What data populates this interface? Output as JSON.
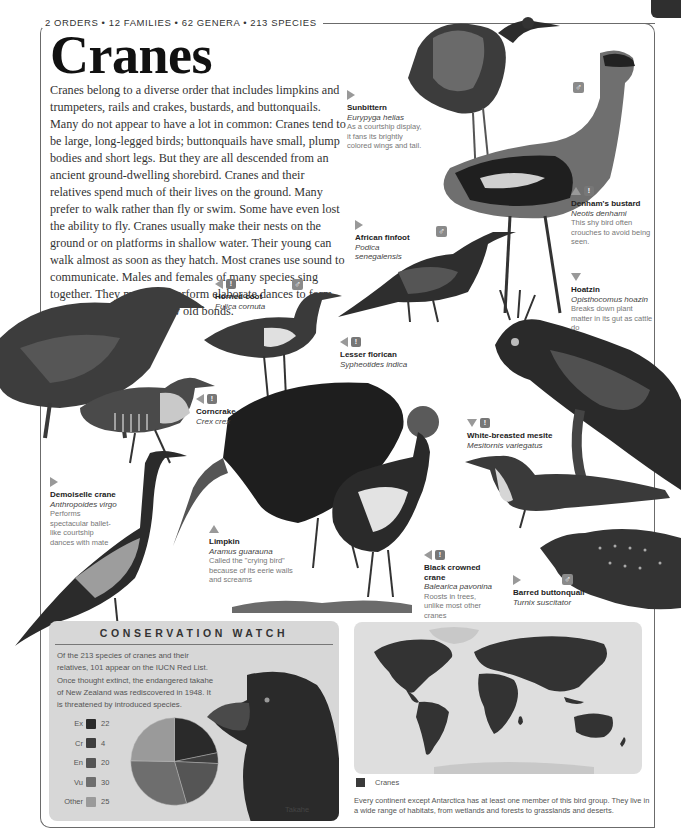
{
  "header": {
    "stats": "2 ORDERS • 12 FAMILIES • 62 GENERA • 213 SPECIES",
    "title": "Cranes"
  },
  "intro": "Cranes belong to a diverse order that includes limpkins and trumpeters, rails and crakes, bustards, and buttonquails. Many do not appear to have a lot in common: Cranes tend to be large, long-legged birds; buttonquails have small, plump bodies and short legs. But they are all descended from an ancient ground-dwelling shorebird. Cranes and their relatives spend much of their lives on the ground. Many prefer to walk rather than fly or swim. Some have even lost the ability to fly. Cranes usually make their nests on the ground or on platforms in shallow water. Their young can walk almost as soon as they hatch. Most cranes use sound to communicate. Males and females of many species sing together. They may also perform elaborate dances to form new mating pairs or renew old bonds.",
  "species": [
    {
      "id": "sunbittern",
      "common": "Sunbittern",
      "latin": "Eurypyga helias",
      "desc": "As a courtship display, it fans its brightly colored wings and tail.",
      "pointer": "right",
      "status": ""
    },
    {
      "id": "denhams-bustard",
      "common": "Denham's bustard",
      "latin": "Neotis denhami",
      "desc": "This shy bird often crouches to avoid being seen.",
      "pointer": "up",
      "status": "!"
    },
    {
      "id": "african-finfoot",
      "common": "African finfoot",
      "latin": "Podica senegalensis",
      "desc": "",
      "pointer": "right",
      "status": ""
    },
    {
      "id": "hoatzin",
      "common": "Hoatzin",
      "latin": "Opisthocomus hoazin",
      "desc": "Breaks down plant matter in its gut as cattle do",
      "pointer": "down",
      "status": ""
    },
    {
      "id": "horned-coot",
      "common": "Horned coot",
      "latin": "Fulica cornuta",
      "desc": "",
      "pointer": "left",
      "status": "!"
    },
    {
      "id": "lesser-florican",
      "common": "Lesser florican",
      "latin": "Sypheotides indica",
      "desc": "",
      "pointer": "left",
      "status": "!"
    },
    {
      "id": "corncrake",
      "common": "Corncrake",
      "latin": "Crex crex",
      "desc": "",
      "pointer": "left",
      "status": "!"
    },
    {
      "id": "white-breasted-mesite",
      "common": "White-breasted mesite",
      "latin": "Mesitornis variegatus",
      "desc": "",
      "pointer": "down",
      "status": "!"
    },
    {
      "id": "demoiselle-crane",
      "common": "Demoiselle crane",
      "latin": "Anthropoides virgo",
      "desc": "Performs spectacular ballet-like courtship dances with mate",
      "pointer": "right",
      "status": ""
    },
    {
      "id": "limpkin",
      "common": "Limpkin",
      "latin": "Aramus guarauna",
      "desc": "Called the \"crying bird\" because of its eerie wails and screams",
      "pointer": "up",
      "status": ""
    },
    {
      "id": "black-crowned-crane",
      "common": "Black crowned crane",
      "latin": "Balearica pavonina",
      "desc": "Roosts in trees, unlike most other cranes",
      "pointer": "left",
      "status": "!"
    },
    {
      "id": "barred-buttonquail",
      "common": "Barred buttonquail",
      "latin": "Turnix suscitator",
      "desc": "",
      "pointer": "right",
      "status": ""
    }
  ],
  "male_symbol": "♂",
  "conservation": {
    "title": "CONSERVATION WATCH",
    "text": "Of the 213 species of cranes and their relatives, 101 appear on the IUCN Red List. Once thought extinct, the endangered takahe of New Zealand was rediscovered in 1948. It is threatened by introduced species.",
    "image_label": "Takahe",
    "legend": [
      {
        "code": "Ex",
        "value": "22",
        "color": "#2a2a2a",
        "glyph": "†"
      },
      {
        "code": "Cr",
        "value": "4",
        "color": "#3e3e3e",
        "glyph": "!"
      },
      {
        "code": "En",
        "value": "20",
        "color": "#555555",
        "glyph": "!"
      },
      {
        "code": "Vu",
        "value": "30",
        "color": "#6e6e6e",
        "glyph": "!"
      },
      {
        "code": "Other",
        "value": "25",
        "color": "#9a9a9a",
        "glyph": "!"
      }
    ]
  },
  "chart_data": {
    "type": "pie",
    "categories": [
      "Ex",
      "Cr",
      "En",
      "Vu",
      "Other"
    ],
    "values": [
      22,
      4,
      20,
      30,
      25
    ],
    "colors": [
      "#2a2a2a",
      "#3e3e3e",
      "#555555",
      "#6e6e6e",
      "#9a9a9a"
    ]
  },
  "map": {
    "legend_label": "Cranes",
    "legend_color": "#3a3a3a",
    "caption": "Every continent except Antarctica has at least one member of this bird group. They live in a wide range of habitats, from wetlands and forests to grasslands and deserts."
  }
}
